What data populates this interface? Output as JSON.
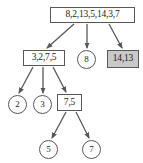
{
  "diagram": {
    "type": "tree",
    "title": "",
    "colors": {
      "node_border": "#58585a",
      "node_fill": "#ffffff",
      "shaded_fill": "#c9c9c9",
      "edge": "#58585a",
      "text": "#1c1c1c"
    },
    "nodes": [
      {
        "id": "root",
        "label": "8,2,13,5,14,3,7",
        "shape": "rect",
        "shaded": false,
        "level": 0,
        "x": 50,
        "y": 7,
        "width": 85,
        "height": 16,
        "font_size": 9.5
      },
      {
        "id": "n-3275",
        "label": "3,2,7,5",
        "shape": "rect",
        "shaded": false,
        "level": 1,
        "x": 23,
        "y": 50,
        "width": 42,
        "height": 16,
        "font_size": 9.5
      },
      {
        "id": "n-8",
        "label": "8",
        "shape": "circle",
        "shaded": false,
        "level": 1,
        "x": 77,
        "y": 50,
        "width": 19,
        "height": 19,
        "font_size": 9
      },
      {
        "id": "n-1413",
        "label": "14,13",
        "shape": "rect",
        "shaded": true,
        "level": 1,
        "x": 107,
        "y": 50,
        "width": 32,
        "height": 18,
        "font_size": 9.5
      },
      {
        "id": "n-2",
        "label": "2",
        "shape": "circle",
        "shaded": false,
        "level": 2,
        "x": 8,
        "y": 95,
        "width": 19,
        "height": 19,
        "font_size": 9
      },
      {
        "id": "n-3",
        "label": "3",
        "shape": "circle",
        "shaded": false,
        "level": 2,
        "x": 33,
        "y": 95,
        "width": 19,
        "height": 19,
        "font_size": 9
      },
      {
        "id": "n-75",
        "label": "7,5",
        "shape": "rect",
        "shaded": false,
        "level": 2,
        "x": 57,
        "y": 94,
        "width": 25,
        "height": 17,
        "font_size": 9.5
      },
      {
        "id": "n-5",
        "label": "5",
        "shape": "circle",
        "shaded": false,
        "level": 3,
        "x": 39,
        "y": 140,
        "width": 19,
        "height": 19,
        "font_size": 9
      },
      {
        "id": "n-7",
        "label": "7",
        "shape": "circle",
        "shaded": false,
        "level": 3,
        "x": 82,
        "y": 140,
        "width": 19,
        "height": 19,
        "font_size": 9
      }
    ],
    "edges": [
      {
        "id": "e-root-3275",
        "from": "root",
        "to": "n-3275",
        "x1": 74,
        "y1": 24,
        "x2": 47,
        "y2": 48,
        "arrow": true
      },
      {
        "id": "e-root-8",
        "from": "root",
        "to": "n-8",
        "x1": 87,
        "y1": 24,
        "x2": 87,
        "y2": 48,
        "arrow": true
      },
      {
        "id": "e-root-1413",
        "from": "root",
        "to": "n-1413",
        "x1": 109,
        "y1": 24,
        "x2": 122,
        "y2": 48,
        "arrow": true
      },
      {
        "id": "e-3275-2",
        "from": "n-3275",
        "to": "n-2",
        "x1": 33,
        "y1": 67,
        "x2": 19,
        "y2": 93,
        "arrow": true
      },
      {
        "id": "e-3275-3",
        "from": "n-3275",
        "to": "n-3",
        "x1": 43,
        "y1": 67,
        "x2": 43,
        "y2": 93,
        "arrow": true
      },
      {
        "id": "e-3275-75",
        "from": "n-3275",
        "to": "n-75",
        "x1": 53,
        "y1": 67,
        "x2": 66,
        "y2": 92,
        "arrow": true
      },
      {
        "id": "e-75-5",
        "from": "n-75",
        "to": "n-5",
        "x1": 66,
        "y1": 112,
        "x2": 52,
        "y2": 138,
        "arrow": true
      },
      {
        "id": "e-75-7",
        "from": "n-75",
        "to": "n-7",
        "x1": 76,
        "y1": 112,
        "x2": 89,
        "y2": 138,
        "arrow": true
      }
    ]
  }
}
